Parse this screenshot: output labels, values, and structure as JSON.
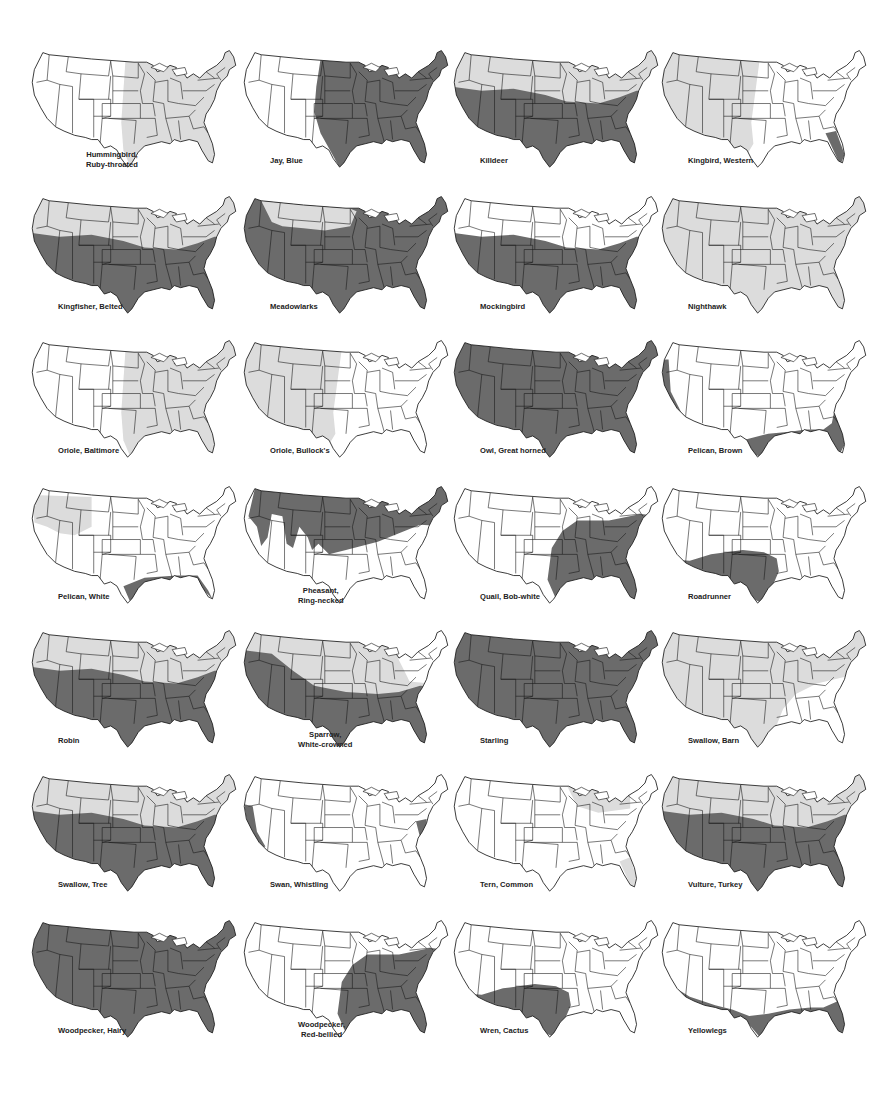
{
  "page": {
    "legend": {
      "dark_shade_color": "#6b6b6b",
      "light_shade_color": "#dcdcdc",
      "outline_color": "#1a1a1a",
      "background_color": "#ffffff"
    }
  },
  "maps": [
    {
      "name": "Hummingbird, Ruby-throated",
      "label_line1": "Hummingbird,",
      "label_line2": "Ruby-throated",
      "shade": "light",
      "region": "east-of-plains"
    },
    {
      "name": "Jay, Blue",
      "label_line1": "Jay, Blue",
      "label_line2": "",
      "shade": "dark",
      "region": "east-of-rockies"
    },
    {
      "name": "Killdeer",
      "label_line1": "Killdeer",
      "label_line2": "",
      "shade": "mixed",
      "region": "north-light-south-dark"
    },
    {
      "name": "Kingbird, Western",
      "label_line1": "Kingbird, Western",
      "label_line2": "",
      "shade": "light",
      "region": "west-plus-florida-dark"
    },
    {
      "name": "Kingfisher, Belted",
      "label_line1": "Kingfisher, Belted",
      "label_line2": "",
      "shade": "mixed",
      "region": "north-light-south-dark"
    },
    {
      "name": "Meadowlarks",
      "label_line1": "Meadowlarks",
      "label_line2": "",
      "shade": "mixed",
      "region": "mostly-dark-north-light"
    },
    {
      "name": "Mockingbird",
      "label_line1": "Mockingbird",
      "label_line2": "",
      "shade": "dark",
      "region": "south"
    },
    {
      "name": "Nighthawk",
      "label_line1": "Nighthawk",
      "label_line2": "",
      "shade": "light",
      "region": "all"
    },
    {
      "name": "Oriole, Baltimore",
      "label_line1": "Oriole, Baltimore",
      "label_line2": "",
      "shade": "light",
      "region": "east-of-plains"
    },
    {
      "name": "Oriole, Bullock's",
      "label_line1": "Oriole, Bullock's",
      "label_line2": "",
      "shade": "light",
      "region": "west"
    },
    {
      "name": "Owl, Great horned",
      "label_line1": "Owl, Great horned",
      "label_line2": "",
      "shade": "dark",
      "region": "all"
    },
    {
      "name": "Pelican, Brown",
      "label_line1": "Pelican, Brown",
      "label_line2": "",
      "shade": "dark",
      "region": "coasts"
    },
    {
      "name": "Pelican, White",
      "label_line1": "Pelican, White",
      "label_line2": "",
      "shade": "mixed",
      "region": "northwest-light-gulf-dark"
    },
    {
      "name": "Pheasant, Ring-necked",
      "label_line1": "Pheasant,",
      "label_line2": "Ring-necked",
      "shade": "dark",
      "region": "north"
    },
    {
      "name": "Quail, Bob-white",
      "label_line1": "Quail, Bob-white",
      "label_line2": "",
      "shade": "dark",
      "region": "southeast"
    },
    {
      "name": "Roadrunner",
      "label_line1": "Roadrunner",
      "label_line2": "",
      "shade": "dark",
      "region": "southwest"
    },
    {
      "name": "Robin",
      "label_line1": "Robin",
      "label_line2": "",
      "shade": "mixed",
      "region": "north-light-south-dark"
    },
    {
      "name": "Sparrow, White-crowned",
      "label_line1": "Sparrow,",
      "label_line2": "White-crowned",
      "shade": "mixed",
      "region": "west-dark-north-light"
    },
    {
      "name": "Starling",
      "label_line1": "Starling",
      "label_line2": "",
      "shade": "dark",
      "region": "all"
    },
    {
      "name": "Swallow, Barn",
      "label_line1": "Swallow, Barn",
      "label_line2": "",
      "shade": "light",
      "region": "all-but-southeast"
    },
    {
      "name": "Swallow, Tree",
      "label_line1": "Swallow, Tree",
      "label_line2": "",
      "shade": "mixed",
      "region": "north-light-south-dark"
    },
    {
      "name": "Swan, Whistling",
      "label_line1": "Swan, Whistling",
      "label_line2": "",
      "shade": "dark",
      "region": "pacific-atlantic-coast"
    },
    {
      "name": "Tern, Common",
      "label_line1": "Tern, Common",
      "label_line2": "",
      "shade": "light",
      "region": "great-lakes-florida"
    },
    {
      "name": "Vulture, Turkey",
      "label_line1": "Vulture, Turkey",
      "label_line2": "",
      "shade": "mixed",
      "region": "north-light-south-dark"
    },
    {
      "name": "Woodpecker, Hairy",
      "label_line1": "Woodpecker, Hairy",
      "label_line2": "",
      "shade": "dark",
      "region": "all"
    },
    {
      "name": "Woodpecker, Red-bellied",
      "label_line1": "Woodpecker,",
      "label_line2": "Red-bellied",
      "shade": "dark",
      "region": "southeast"
    },
    {
      "name": "Wren, Cactus",
      "label_line1": "Wren, Cactus",
      "label_line2": "",
      "shade": "dark",
      "region": "southwest"
    },
    {
      "name": "Yellowlegs",
      "label_line1": "Yellowlegs",
      "label_line2": "",
      "shade": "dark",
      "region": "southern-coasts"
    }
  ]
}
